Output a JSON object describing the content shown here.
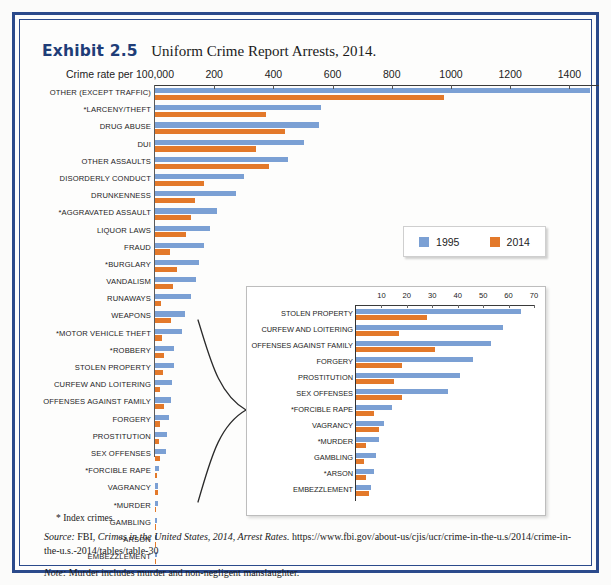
{
  "exhibit": {
    "label": "Exhibit 2.5",
    "title": "Uniform Crime Report Arrests, 2014."
  },
  "legend": {
    "series": [
      {
        "name": "1995",
        "color": "#7ba0d4"
      },
      {
        "name": "2014",
        "color": "#e3792a"
      }
    ]
  },
  "footnotes": {
    "index_crimes": "* Index crimes",
    "source_label": "Source:",
    "source_text_1": "FBI,",
    "source_italic": "Crimes in the United States, 2014, Arrest Rates.",
    "source_url": "https://www.fbi.gov/about-us/cjis/ucr/crime-in-the-u.s/2014/crime-in-the-u.s.-2014/tables/table-30",
    "note_label": "Note:",
    "note_text": "Murder includes murder and non-negligent manslaughter."
  },
  "chart_data": [
    {
      "type": "bar",
      "orientation": "horizontal",
      "id": "main-chart",
      "title": "Uniform Crime Report Arrests, 2014.",
      "xlabel": "Crime rate per 100,000",
      "ylabel": "",
      "xlim": [
        0,
        1500
      ],
      "xticks": [
        200,
        400,
        600,
        800,
        1000,
        1200,
        1400
      ],
      "grid": false,
      "legend_position": "inside-right",
      "categories": [
        "OTHER (EXCEPT TRAFFIC)",
        "*LARCENY/THEFT",
        "DRUG ABUSE",
        "DUI",
        "OTHER ASSAULTS",
        "DISORDERLY CONDUCT",
        "DRUNKENNESS",
        "*AGGRAVATED ASSAULT",
        "LIQUOR LAWS",
        "FRAUD",
        "*BURGLARY",
        "VANDALISM",
        "RUNAWAYS",
        "WEAPONS",
        "*MOTOR VEHICLE THEFT",
        "*ROBBERY",
        "STOLEN PROPERTY",
        "CURFEW AND LOITERING",
        "OFFENSES AGAINST FAMILY",
        "FORGERY",
        "PROSTITUTION",
        "SEX OFFENSES",
        "*FORCIBLE RAPE",
        "VAGRANCY",
        "*MURDER",
        "GAMBLING",
        "*ARSON",
        "EMBEZZLEMENT"
      ],
      "series": [
        {
          "name": "1995",
          "color": "#7ba0d4",
          "values": [
            1470,
            560,
            555,
            505,
            450,
            300,
            275,
            210,
            185,
            165,
            150,
            140,
            120,
            100,
            90,
            65,
            65,
            58,
            53,
            46,
            41,
            36,
            14,
            11,
            9,
            8,
            7,
            6
          ]
        },
        {
          "name": "2014",
          "color": "#e3792a",
          "values": [
            975,
            375,
            440,
            340,
            385,
            165,
            135,
            120,
            105,
            50,
            75,
            60,
            20,
            55,
            25,
            30,
            28,
            17,
            31,
            18,
            15,
            18,
            7,
            9,
            4,
            3,
            4,
            5
          ]
        }
      ]
    },
    {
      "type": "bar",
      "orientation": "horizontal",
      "id": "inset-chart",
      "title": "",
      "xlabel": "",
      "ylabel": "",
      "xlim": [
        0,
        70
      ],
      "xticks": [
        10,
        20,
        30,
        40,
        50,
        60,
        70
      ],
      "grid": false,
      "categories": [
        "STOLEN PROPERTY",
        "CURFEW AND LOITERING",
        "OFFENSES AGAINST FAMILY",
        "FORGERY",
        "PROSTITUTION",
        "SEX OFFENSES",
        "*FORCIBLE RAPE",
        "VAGRANCY",
        "*MURDER",
        "GAMBLING",
        "*ARSON",
        "EMBEZZLEMENT"
      ],
      "series": [
        {
          "name": "1995",
          "color": "#7ba0d4",
          "values": [
            65,
            58,
            53,
            46,
            41,
            36,
            14,
            11,
            9,
            8,
            7,
            6
          ]
        },
        {
          "name": "2014",
          "color": "#e3792a",
          "values": [
            28,
            17,
            31,
            18,
            15,
            18,
            7,
            9,
            4,
            3,
            4,
            5
          ]
        }
      ]
    }
  ]
}
